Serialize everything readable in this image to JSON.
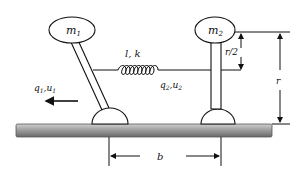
{
  "diagram": {
    "type": "two-mass spring system on ground",
    "masses": [
      {
        "label": "m",
        "subscript": "1"
      },
      {
        "label": "m",
        "subscript": "2"
      }
    ],
    "spring": {
      "label": "l, k",
      "coils": 9
    },
    "coordinates": [
      {
        "label": "q",
        "sub1": "1",
        "mid": ",u",
        "sub2": "1"
      },
      {
        "label": "q",
        "sub1": "2",
        "mid": ",u",
        "sub2": "2"
      }
    ],
    "dimensions": {
      "half_height": "r/2",
      "height": "r",
      "base_separation": "b"
    },
    "colors": {
      "line": "#111111",
      "ground_light": "#b5b5b5",
      "ground_dark": "#6a6a6a"
    }
  }
}
